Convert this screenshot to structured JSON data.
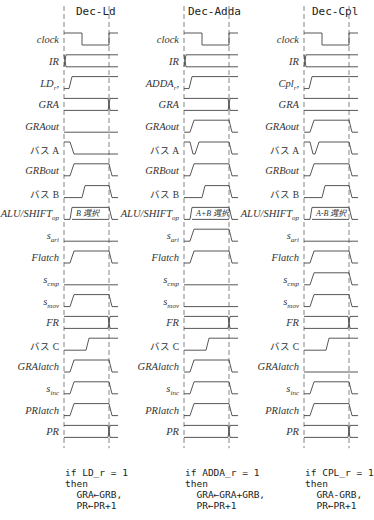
{
  "layout": {
    "row_top": 30,
    "row_step": 21.8,
    "row_high_offset": 3,
    "row_low_offset": 15,
    "panel_x": [
      0,
      120,
      240
    ],
    "wave_start": 64,
    "wave_clock2": 109,
    "wave_end": 118
  },
  "rows": [
    {
      "key": "clock",
      "label": "clock"
    },
    {
      "key": "IR",
      "label": "IR"
    },
    {
      "key": "op_r",
      "label": ""
    },
    {
      "key": "GRA",
      "label": "GRA"
    },
    {
      "key": "GRAout",
      "label": "GRAout"
    },
    {
      "key": "busA",
      "label": "バス A"
    },
    {
      "key": "GRBout",
      "label": "GRBout"
    },
    {
      "key": "busB",
      "label": "バス B"
    },
    {
      "key": "aluop",
      "label": "ALU/SHIFT",
      "sub": "op"
    },
    {
      "key": "s_ari",
      "label": "s",
      "sub": "ari"
    },
    {
      "key": "Flatch",
      "label": "Flatch"
    },
    {
      "key": "s_cmp",
      "label": "s",
      "sub": "cmp"
    },
    {
      "key": "s_mov",
      "label": "s",
      "sub": "mov"
    },
    {
      "key": "FR",
      "label": "FR"
    },
    {
      "key": "busC",
      "label": "バス C"
    },
    {
      "key": "GRAlatch",
      "label": "GRAlatch"
    },
    {
      "key": "s_inc",
      "label": "s",
      "sub": "inc"
    },
    {
      "key": "PRlatch",
      "label": "PRlatch"
    },
    {
      "key": "PR",
      "label": "PR"
    }
  ],
  "panels": [
    {
      "title": "Dec-Ld",
      "op_label": "LD",
      "op_sub": "r",
      "alu_text": "B 選択",
      "waves": {
        "clock": "clock",
        "IR": "bus_change_start",
        "op_r": "rise_early",
        "GRA": "bus_change_end",
        "GRAout": "low",
        "busA": "fall_early",
        "GRBout": "pulse_early",
        "busB": "pulse_late",
        "aluop": "alu",
        "s_ari": "low",
        "Flatch": "pulse_early",
        "s_cmp": "low",
        "s_mov": "pulse_early",
        "FR": "bus_change_end",
        "busC": "rise_late",
        "GRAlatch": "pulse_early",
        "s_inc": "pulse_early",
        "PRlatch": "pulse_early",
        "PR": "bus_change_end"
      },
      "note": [
        "if LD_r = 1",
        "then",
        "  GRA←GRB,",
        "  PR←PR+1"
      ]
    },
    {
      "title": "Dec-Adda",
      "op_label": "ADDA",
      "op_sub": "r",
      "alu_text": "A+B 選択",
      "waves": {
        "clock": "clock",
        "IR": "bus_change_start",
        "op_r": "rise_early",
        "GRA": "bus_change_end",
        "GRAout": "pulse_early",
        "busA": "fall_then_rise",
        "GRBout": "pulse_early",
        "busB": "pulse_late",
        "aluop": "alu",
        "s_ari": "pulse_early",
        "Flatch": "pulse_early",
        "s_cmp": "low",
        "s_mov": "low",
        "FR": "bus_change_end",
        "busC": "rise_late",
        "GRAlatch": "pulse_early",
        "s_inc": "pulse_early",
        "PRlatch": "pulse_early",
        "PR": "bus_change_end"
      },
      "note": [
        "if ADDA_r = 1",
        "then",
        "  GRA←GRA+GRB,",
        "  PR←PR+1"
      ]
    },
    {
      "title": "Dec-Cpl",
      "op_label": "Cpl",
      "op_sub": "r",
      "alu_text": "A-B 選択",
      "waves": {
        "clock": "clock",
        "IR": "bus_change_start",
        "op_r": "rise_early",
        "GRA": "bus_flat",
        "GRAout": "pulse_early",
        "busA": "fall_then_rise",
        "GRBout": "pulse_early",
        "busB": "pulse_late",
        "aluop": "alu",
        "s_ari": "low",
        "Flatch": "pulse_early",
        "s_cmp": "pulse_early",
        "s_mov": "pulse_early",
        "FR": "bus_change_end",
        "busC": "rise_late",
        "GRAlatch": "low",
        "s_inc": "pulse_early",
        "PRlatch": "pulse_early",
        "PR": "bus_change_end"
      },
      "note": [
        "if CPL_r = 1",
        "then",
        "  GRA-GRB,",
        "  PR←PR+1"
      ]
    }
  ]
}
